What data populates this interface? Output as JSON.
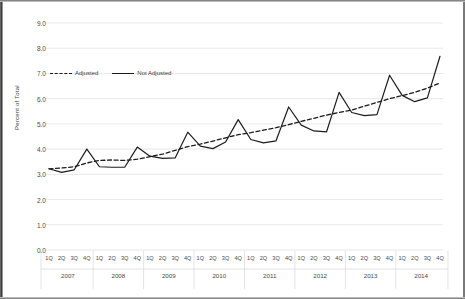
{
  "chart_data": {
    "type": "line",
    "title": "",
    "xlabel": "",
    "ylabel": "Percent of Total",
    "ylim": [
      0.0,
      9.0
    ],
    "ytick_labels": [
      "0.0",
      "1.0",
      "2.0",
      "3.0",
      "4.0",
      "5.0",
      "6.0",
      "7.0",
      "8.0",
      "9.0"
    ],
    "ytick_values": [
      0.0,
      1.0,
      2.0,
      3.0,
      4.0,
      5.0,
      6.0,
      7.0,
      8.0,
      9.0
    ],
    "grid": true,
    "legend_position": "upper left inside",
    "quarter_labels": [
      "1Q",
      "2Q",
      "3Q",
      "4Q"
    ],
    "year_groups": [
      "2007",
      "2008",
      "2009",
      "2010",
      "2011",
      "2012",
      "2013",
      "2014"
    ],
    "categories": [
      "1Q 2007",
      "2Q 2007",
      "3Q 2007",
      "4Q 2007",
      "1Q 2008",
      "2Q 2008",
      "3Q 2008",
      "4Q 2008",
      "1Q 2009",
      "2Q 2009",
      "3Q 2009",
      "4Q 2009",
      "1Q 2010",
      "2Q 2010",
      "3Q 2010",
      "4Q 2010",
      "1Q 2011",
      "2Q 2011",
      "3Q 2011",
      "4Q 2011",
      "1Q 2012",
      "2Q 2012",
      "3Q 2012",
      "4Q 2012",
      "1Q 2013",
      "2Q 2013",
      "3Q 2013",
      "4Q 2013",
      "1Q 2014",
      "2Q 2014",
      "3Q 2014",
      "4Q 2014"
    ],
    "series": [
      {
        "name": "Adjusted",
        "style": "dashed",
        "color": "#1c1c1c",
        "values": [
          3.22,
          3.25,
          3.3,
          3.45,
          3.55,
          3.57,
          3.55,
          3.6,
          3.7,
          3.8,
          3.95,
          4.1,
          4.2,
          4.32,
          4.45,
          4.57,
          4.65,
          4.75,
          4.85,
          4.97,
          5.1,
          5.22,
          5.35,
          5.45,
          5.55,
          5.7,
          5.85,
          6.0,
          6.12,
          6.25,
          6.42,
          6.62
        ]
      },
      {
        "name": "Not Adjusted",
        "style": "solid",
        "color": "#1c1c1c",
        "values": [
          3.22,
          3.08,
          3.18,
          4.0,
          3.3,
          3.28,
          3.28,
          4.08,
          3.72,
          3.63,
          3.65,
          4.67,
          4.12,
          4.02,
          4.28,
          5.17,
          4.38,
          4.25,
          4.33,
          5.67,
          4.95,
          4.72,
          4.68,
          6.25,
          5.45,
          5.33,
          5.37,
          6.93,
          6.13,
          5.88,
          6.03,
          7.68
        ]
      }
    ]
  },
  "legend": {
    "adjusted_label": "Adjusted",
    "not_adjusted_label": "Not Adjusted"
  }
}
